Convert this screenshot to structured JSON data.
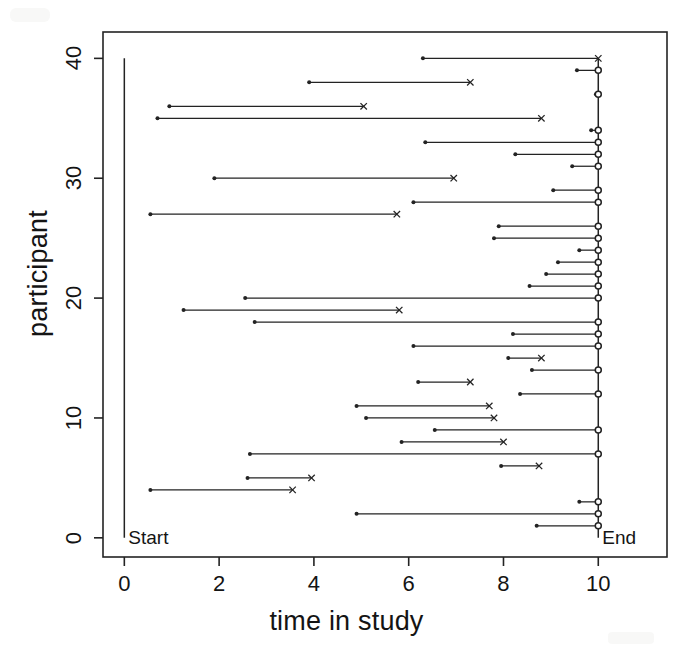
{
  "figure": {
    "xlabel": "time in study",
    "ylabel": "participant",
    "annotations": {
      "start": "Start",
      "end": "End"
    }
  },
  "chart_data": {
    "type": "line",
    "title": "",
    "xlabel": "time in study",
    "ylabel": "participant",
    "xlim": [
      -0.45,
      11.45
    ],
    "ylim": [
      -1.6,
      42.2
    ],
    "xticks": [
      0,
      2,
      4,
      6,
      8,
      10
    ],
    "xtick_labels": [
      "0",
      "2",
      "4",
      "6",
      "8",
      "10"
    ],
    "yticks": [
      0,
      10,
      20,
      30,
      40
    ],
    "ytick_labels": [
      "0",
      "10",
      "20",
      "30",
      "40"
    ],
    "grid": false,
    "legend": null,
    "annotations": [
      {
        "text": "Start",
        "x": 0,
        "y": 0,
        "align": "left"
      },
      {
        "text": "End",
        "x": 10,
        "y": 0,
        "align": "left"
      }
    ],
    "reference_lines": [
      {
        "orientation": "vertical",
        "x": 0,
        "y_from": 0,
        "y_to": 40,
        "label": "Start"
      },
      {
        "orientation": "vertical",
        "x": 10,
        "y_from": 0,
        "y_to": 40,
        "label": "End"
      }
    ],
    "marker_legend": {
      "start_marker": "filled-dot",
      "event_marker": "x (event / death)",
      "censor_marker": "open-circle (censored at end of study)"
    },
    "series": [
      {
        "participant": 40,
        "start": 6.3,
        "stop": 10.0,
        "end_marker": "x"
      },
      {
        "participant": 39,
        "start": 9.55,
        "stop": 10.0,
        "end_marker": "o"
      },
      {
        "participant": 38,
        "start": 3.9,
        "stop": 7.3,
        "end_marker": "x"
      },
      {
        "participant": 37,
        "start": 9.95,
        "stop": 10.0,
        "end_marker": "o"
      },
      {
        "participant": 36,
        "start": 0.95,
        "stop": 5.05,
        "end_marker": "x"
      },
      {
        "participant": 35,
        "start": 0.7,
        "stop": 8.8,
        "end_marker": "x"
      },
      {
        "participant": 34,
        "start": 9.85,
        "stop": 10.0,
        "end_marker": "o"
      },
      {
        "participant": 33,
        "start": 6.35,
        "stop": 10.0,
        "end_marker": "o"
      },
      {
        "participant": 32,
        "start": 8.25,
        "stop": 10.0,
        "end_marker": "o"
      },
      {
        "participant": 31,
        "start": 9.45,
        "stop": 10.0,
        "end_marker": "o"
      },
      {
        "participant": 30,
        "start": 1.9,
        "stop": 6.95,
        "end_marker": "x"
      },
      {
        "participant": 29,
        "start": 9.05,
        "stop": 10.0,
        "end_marker": "o"
      },
      {
        "participant": 28,
        "start": 6.1,
        "stop": 10.0,
        "end_marker": "o"
      },
      {
        "participant": 27,
        "start": 0.55,
        "stop": 5.75,
        "end_marker": "x"
      },
      {
        "participant": 26,
        "start": 7.9,
        "stop": 10.0,
        "end_marker": "o"
      },
      {
        "participant": 25,
        "start": 7.8,
        "stop": 10.0,
        "end_marker": "o"
      },
      {
        "participant": 24,
        "start": 9.6,
        "stop": 10.0,
        "end_marker": "o"
      },
      {
        "participant": 23,
        "start": 9.15,
        "stop": 10.0,
        "end_marker": "o"
      },
      {
        "participant": 22,
        "start": 8.9,
        "stop": 10.0,
        "end_marker": "o"
      },
      {
        "participant": 21,
        "start": 8.55,
        "stop": 10.0,
        "end_marker": "o"
      },
      {
        "participant": 20,
        "start": 2.55,
        "stop": 10.0,
        "end_marker": "o"
      },
      {
        "participant": 19,
        "start": 1.25,
        "stop": 5.8,
        "end_marker": "x"
      },
      {
        "participant": 18,
        "start": 2.75,
        "stop": 10.0,
        "end_marker": "o"
      },
      {
        "participant": 17,
        "start": 8.2,
        "stop": 10.0,
        "end_marker": "o"
      },
      {
        "participant": 16,
        "start": 6.1,
        "stop": 10.0,
        "end_marker": "o"
      },
      {
        "participant": 15,
        "start": 8.1,
        "stop": 8.8,
        "end_marker": "x"
      },
      {
        "participant": 14,
        "start": 8.6,
        "stop": 10.0,
        "end_marker": "o"
      },
      {
        "participant": 13,
        "start": 6.2,
        "stop": 7.3,
        "end_marker": "x"
      },
      {
        "participant": 12,
        "start": 8.35,
        "stop": 10.0,
        "end_marker": "o"
      },
      {
        "participant": 11,
        "start": 4.9,
        "stop": 7.7,
        "end_marker": "x"
      },
      {
        "participant": 10,
        "start": 5.1,
        "stop": 7.8,
        "end_marker": "x"
      },
      {
        "participant": 9,
        "start": 6.55,
        "stop": 10.0,
        "end_marker": "o"
      },
      {
        "participant": 8,
        "start": 5.85,
        "stop": 8.0,
        "end_marker": "x"
      },
      {
        "participant": 7,
        "start": 2.65,
        "stop": 10.0,
        "end_marker": "o"
      },
      {
        "participant": 6,
        "start": 7.95,
        "stop": 8.75,
        "end_marker": "x"
      },
      {
        "participant": 5,
        "start": 2.6,
        "stop": 3.95,
        "end_marker": "x"
      },
      {
        "participant": 4,
        "start": 0.55,
        "stop": 3.55,
        "end_marker": "x"
      },
      {
        "participant": 3,
        "start": 9.6,
        "stop": 10.0,
        "end_marker": "o"
      },
      {
        "participant": 2,
        "start": 4.9,
        "stop": 10.0,
        "end_marker": "o"
      },
      {
        "participant": 1,
        "start": 8.7,
        "stop": 10.0,
        "end_marker": "o"
      }
    ]
  }
}
